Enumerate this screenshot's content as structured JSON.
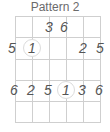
{
  "title": "Pattern 2",
  "strings_x": [
    15,
    32,
    49,
    66,
    83,
    100
  ],
  "frets_y": [
    16,
    37,
    59,
    80,
    101,
    122
  ],
  "notes": [
    {
      "label": "3",
      "string": 3,
      "row": 1,
      "root": false
    },
    {
      "label": "6",
      "string": 4,
      "row": 1,
      "root": false
    },
    {
      "label": "5",
      "string": 1,
      "row": 2,
      "root": false
    },
    {
      "label": "1",
      "string": 2,
      "row": 2,
      "root": true
    },
    {
      "label": "2",
      "string": 5,
      "row": 2,
      "root": false
    },
    {
      "label": "5",
      "string": 6,
      "row": 2,
      "root": false
    },
    {
      "label": "6",
      "string": 1,
      "row": 4,
      "root": false
    },
    {
      "label": "2",
      "string": 2,
      "row": 4,
      "root": false
    },
    {
      "label": "5",
      "string": 3,
      "row": 4,
      "root": false
    },
    {
      "label": "1",
      "string": 4,
      "row": 4,
      "root": true
    },
    {
      "label": "3",
      "string": 5,
      "row": 4,
      "root": false
    },
    {
      "label": "6",
      "string": 6,
      "row": 4,
      "root": false
    }
  ],
  "colors": {
    "grid": "#cfcfcf",
    "text": "#555555",
    "title": "#6b6b6b"
  }
}
